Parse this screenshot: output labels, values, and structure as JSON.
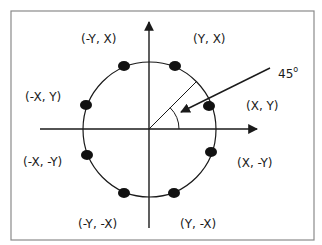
{
  "diagram": {
    "colors": {
      "stroke": "#1a1a1a",
      "frame": "#8a8a8a",
      "background": "#ffffff"
    },
    "center": [
      149,
      129
    ],
    "radius": 67,
    "angle_label": {
      "value": "45",
      "unit": "o"
    },
    "points": [
      {
        "label": "(Y, X)",
        "pos": [
          175,
          66
        ]
      },
      {
        "label": "(X, Y)",
        "pos": [
          209,
          106
        ]
      },
      {
        "label": "(X, -Y)",
        "pos": [
          211,
          152
        ]
      },
      {
        "label": "(Y, -X)",
        "pos": [
          174,
          193
        ]
      },
      {
        "label": "(-Y, -X)",
        "pos": [
          124,
          193
        ]
      },
      {
        "label": "(-X, -Y)",
        "pos": [
          87,
          155
        ]
      },
      {
        "label": "(-X, Y)",
        "pos": [
          86,
          105
        ]
      },
      {
        "label": "(-Y, X)",
        "pos": [
          124,
          66
        ]
      }
    ],
    "labels": {
      "y_x": "(Y, X)",
      "x_y": "(X, Y)",
      "x_neg_y": "(X, -Y)",
      "y_neg_x": "(Y, -X)",
      "neg_y_neg_x": "(-Y, -X)",
      "neg_x_neg_y": "(-X, -Y)",
      "neg_x_y": "(-X, Y)",
      "neg_y_x": "(-Y, X)"
    }
  }
}
